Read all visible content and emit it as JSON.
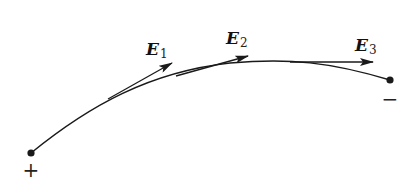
{
  "figure": {
    "colors": {
      "stroke": "#1a1a1a",
      "background": "#ffffff"
    },
    "field_line": {
      "start_charge": {
        "sign": "+",
        "label": "+"
      },
      "end_charge": {
        "sign": "-",
        "label": "−"
      }
    },
    "vectors": [
      {
        "symbol": "E",
        "subscript": "1"
      },
      {
        "symbol": "E",
        "subscript": "2"
      },
      {
        "symbol": "E",
        "subscript": "3"
      }
    ]
  }
}
